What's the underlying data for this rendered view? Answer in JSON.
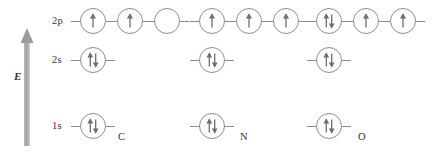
{
  "figure": {
    "type": "orbital-energy-diagram",
    "energy_axis": {
      "label": "E",
      "direction": "up",
      "icon": "up-arrow-icon"
    }
  },
  "shells": [
    {
      "key": "2p",
      "label": "2p"
    },
    {
      "key": "2s",
      "label": "2s"
    },
    {
      "key": "1s",
      "label": "1s"
    }
  ],
  "atoms": [
    {
      "symbol": "C",
      "name_label": "C",
      "configuration": {
        "2p": [
          "up",
          "up",
          "empty"
        ],
        "2s": [
          "updown"
        ],
        "1s": [
          "updown"
        ]
      }
    },
    {
      "symbol": "N",
      "name_label": "N",
      "configuration": {
        "2p": [
          "up",
          "up",
          "up"
        ],
        "2s": [
          "updown"
        ],
        "1s": [
          "updown"
        ]
      }
    },
    {
      "symbol": "O",
      "name_label": "O",
      "configuration": {
        "2p": [
          "updown",
          "up",
          "up"
        ],
        "2s": [
          "updown"
        ],
        "1s": [
          "updown"
        ]
      }
    }
  ],
  "colors": {
    "line": "#8d8d8d",
    "arrow_fill": "#9a9a9a",
    "text": "#333333",
    "background": "#ffffff"
  }
}
